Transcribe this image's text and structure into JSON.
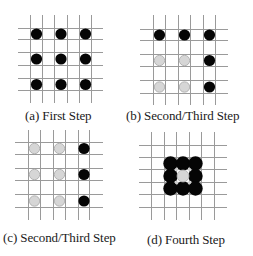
{
  "figure": {
    "colors": {
      "grid_line": "#9a9a9a",
      "black_dot": "#050505",
      "gray_dot_fill": "#d6d6d6",
      "gray_dot_stroke": "#a8a8a8",
      "background": "#ffffff"
    },
    "panels": [
      {
        "id": "a",
        "caption": "(a) First Step",
        "origin": [
          0,
          0
        ],
        "caption_pos": [
          25,
          108
        ],
        "grid": {
          "xs": [
            30,
            42,
            54,
            67,
            79,
            91
          ],
          "ys": [
            28,
            39,
            52,
            65,
            78,
            90
          ],
          "x_extent": [
            18,
            103
          ],
          "y_extent": [
            15,
            103
          ]
        },
        "cells": [
          [
            "black",
            "black",
            "black"
          ],
          [
            "black",
            "black",
            "black"
          ],
          [
            "black",
            "black",
            "black"
          ]
        ],
        "layout": "spaced"
      },
      {
        "id": "b",
        "caption": "(b) Second/Third Step",
        "origin": [
          126,
          0
        ],
        "caption_pos": [
          0,
          108
        ],
        "grid": {
          "xs": [
            27,
            39,
            52,
            64,
            77,
            89
          ],
          "ys": [
            29,
            40,
            54,
            66,
            80,
            93
          ],
          "x_extent": [
            14,
            102
          ],
          "y_extent": [
            15,
            105
          ]
        },
        "cells": [
          [
            "black",
            "black",
            "black"
          ],
          [
            "gray",
            "gray",
            "black"
          ],
          [
            "gray",
            "gray",
            "black"
          ]
        ],
        "layout": "spaced"
      },
      {
        "id": "c",
        "caption": "(c) Second/Third Step",
        "origin": [
          0,
          128
        ],
        "caption_pos": [
          3,
          102
        ],
        "grid": {
          "xs": [
            28,
            40,
            53,
            65,
            78,
            89
          ],
          "ys": [
            14,
            26,
            40,
            52,
            66,
            79
          ],
          "x_extent": [
            15,
            103
          ],
          "y_extent": [
            2,
            92
          ]
        },
        "cells": [
          [
            "gray",
            "gray",
            "black"
          ],
          [
            "gray",
            "gray",
            "black"
          ],
          [
            "gray",
            "gray",
            "black"
          ]
        ],
        "layout": "spaced"
      },
      {
        "id": "d",
        "caption": "(d) Fourth Step",
        "origin": [
          126,
          128
        ],
        "caption_pos": [
          21,
          104
        ],
        "grid": {
          "xs": [
            25,
            38,
            50,
            63,
            75,
            88
          ],
          "ys": [
            17,
            29,
            41,
            54,
            66,
            79
          ],
          "x_extent": [
            13,
            101
          ],
          "y_extent": [
            4,
            92
          ]
        },
        "cells": [
          [
            "black",
            "black",
            "black"
          ],
          [
            "black",
            "gray",
            "black"
          ],
          [
            "black",
            "black",
            "black"
          ]
        ],
        "layout": "packed",
        "block_origin_cell": [
          1,
          1
        ]
      }
    ]
  }
}
